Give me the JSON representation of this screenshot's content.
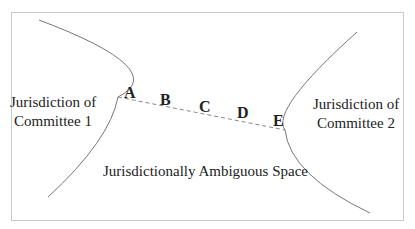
{
  "diagram": {
    "regions": {
      "left": {
        "line1": "Jurisdiction of",
        "line2": "Committee 1"
      },
      "right": {
        "line1": "Jurisdiction of",
        "line2": "Committee 2"
      },
      "middle": "Jurisdictionally Ambiguous Space"
    },
    "points": [
      "A",
      "B",
      "C",
      "D",
      "E"
    ],
    "colors": {
      "frame": "#c8c8c8",
      "curve": "#777777",
      "dash": "#888888",
      "text": "#222222"
    }
  }
}
